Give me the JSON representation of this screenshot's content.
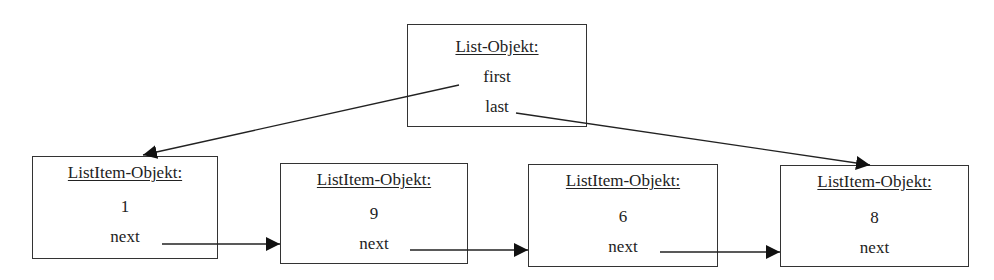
{
  "list_object": {
    "title": "List-Objekt:",
    "fields": [
      "first",
      "last"
    ]
  },
  "list_items": [
    {
      "title": "ListItem-Objekt:",
      "value": "1",
      "pointer": "next"
    },
    {
      "title": "ListItem-Objekt:",
      "value": "9",
      "pointer": "next"
    },
    {
      "title": "ListItem-Objekt:",
      "value": "6",
      "pointer": "next"
    },
    {
      "title": "ListItem-Objekt:",
      "value": "8",
      "pointer": "next"
    }
  ],
  "arrows": [
    {
      "from": "list_object.first",
      "to": "list_items.0"
    },
    {
      "from": "list_object.last",
      "to": "list_items.3"
    },
    {
      "from": "list_items.0.next",
      "to": "list_items.1"
    },
    {
      "from": "list_items.1.next",
      "to": "list_items.2"
    },
    {
      "from": "list_items.2.next",
      "to": "list_items.3"
    }
  ]
}
